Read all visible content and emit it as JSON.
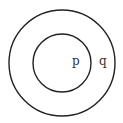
{
  "diagram": {
    "type": "nested-circles",
    "outer_circle": {
      "label": "q",
      "cx": 62,
      "cy": 63,
      "r": 53,
      "stroke": "#222222"
    },
    "inner_circle": {
      "label": "p",
      "cx": 62,
      "cy": 63,
      "r": 29,
      "stroke": "#222222"
    }
  }
}
